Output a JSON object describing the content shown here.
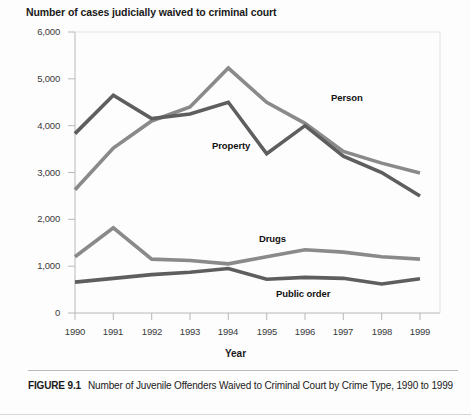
{
  "chart_data": {
    "type": "line",
    "title": "Number of cases judicially waived to criminal court",
    "xlabel": "Year",
    "ylabel": "",
    "categories": [
      "1990",
      "1991",
      "1992",
      "1993",
      "1994",
      "1995",
      "1996",
      "1997",
      "1998",
      "1999"
    ],
    "x": [
      1990,
      1991,
      1992,
      1993,
      1994,
      1995,
      1996,
      1997,
      1998,
      1999
    ],
    "xlim": [
      1990,
      1999
    ],
    "ylim": [
      0,
      6000
    ],
    "ytick_labels": [
      "6,000",
      "5,000",
      "4,000",
      "3,000",
      "2,000",
      "1,000",
      "0"
    ],
    "ytick_values": [
      6000,
      5000,
      4000,
      3000,
      2000,
      1000,
      0
    ],
    "grid": false,
    "legend_position": "inline-annotations",
    "series": [
      {
        "name": "Person",
        "color": "#8a8a8a",
        "values": [
          2630,
          3520,
          4100,
          4400,
          5230,
          4500,
          4050,
          3450,
          3200,
          2990
        ]
      },
      {
        "name": "Property",
        "color": "#5e5e5e",
        "values": [
          3830,
          4650,
          4150,
          4250,
          4500,
          3400,
          4000,
          3350,
          3000,
          2500
        ]
      },
      {
        "name": "Drugs",
        "color": "#8a8a8a",
        "values": [
          1200,
          1820,
          1150,
          1120,
          1050,
          1200,
          1350,
          1300,
          1200,
          1150
        ]
      },
      {
        "name": "Public order",
        "color": "#5e5e5e",
        "values": [
          660,
          740,
          820,
          870,
          950,
          720,
          760,
          740,
          620,
          730
        ]
      }
    ],
    "annotations": [
      {
        "text": "Person",
        "series": "Person"
      },
      {
        "text": "Property",
        "series": "Property"
      },
      {
        "text": "Drugs",
        "series": "Drugs"
      },
      {
        "text": "Public order",
        "series": "Public order"
      }
    ]
  },
  "caption": {
    "figure_number": "FIGURE 9.1",
    "text": "Number of Juvenile Offenders Waived to Criminal Court by Crime Type, 1990 to 1999"
  },
  "colors": {
    "series_light": "#8a8a8a",
    "series_dark": "#5e5e5e",
    "axis": "#b0b0b0",
    "text": "#231f20"
  }
}
